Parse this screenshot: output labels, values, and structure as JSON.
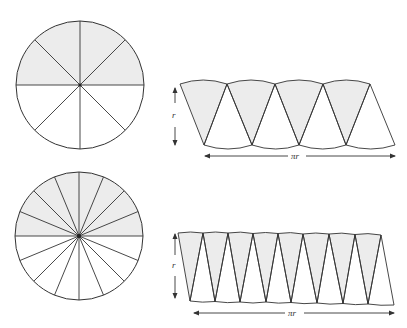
{
  "colors": {
    "stroke": "#333333",
    "shade": "#ececec",
    "background": "#ffffff"
  },
  "figures": [
    {
      "name": "circle-8-sectors",
      "sectors": 8,
      "shaded": "top half",
      "strip": {
        "height_label": "r",
        "length_label": "πr"
      }
    },
    {
      "name": "circle-16-sectors",
      "sectors": 16,
      "shaded": "top half",
      "strip": {
        "height_label": "r",
        "length_label": "πr"
      }
    }
  ],
  "labels": {
    "r_top": "r",
    "pir_top": "πr",
    "r_bottom": "r",
    "pir_bottom": "πr"
  }
}
